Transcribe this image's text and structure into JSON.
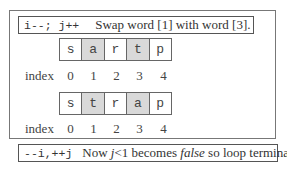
{
  "top_label": {
    "code": "i--; j++",
    "description": "Swap word [1] with word [3]."
  },
  "row1": {
    "cells": [
      "s",
      "a",
      "r",
      "t",
      "p"
    ],
    "highlighted": [
      1,
      3
    ]
  },
  "row2": {
    "cells": [
      "s",
      "t",
      "r",
      "a",
      "p"
    ],
    "highlighted": [
      1,
      3
    ]
  },
  "index_label": "index",
  "indices": [
    "0",
    "1",
    "2",
    "3",
    "4"
  ],
  "bottom_label": {
    "code": "--i,++j",
    "desc_prefix": "Now ",
    "desc_var": "j",
    "desc_mid": "<1 becomes ",
    "desc_false": "false",
    "desc_suffix": " so loop terminates."
  },
  "colors": {
    "highlight": "#d9d9d9",
    "border": "#666666"
  }
}
